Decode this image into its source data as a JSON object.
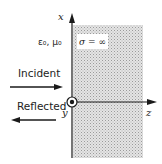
{
  "diagram": {
    "type": "plane-wave-reflection-from-perfect-conductor",
    "axes": {
      "vertical": "x",
      "horizontal": "z",
      "out_of_page": "y"
    },
    "regions": {
      "left_medium": {
        "label": "ε0, μ0"
      },
      "right_medium": {
        "label": "σ = ∞",
        "fill": "hatched-gray"
      }
    },
    "waves": [
      {
        "label": "Incident",
        "direction": "right"
      },
      {
        "label": "Reflected",
        "direction": "left"
      }
    ],
    "origin_symbol": "dot-in-circle (y out of page)"
  },
  "labels": {
    "x_axis": "x",
    "z_axis": "z",
    "y_axis": "y",
    "left_medium": "ε₀, μ₀",
    "conductor": "σ = ∞",
    "incident": "Incident",
    "reflected": "Reflected"
  },
  "colors": {
    "line": "#1a1a1a",
    "hatch": "#bdbdbd",
    "hatch_bg": "#e6e6e6"
  }
}
